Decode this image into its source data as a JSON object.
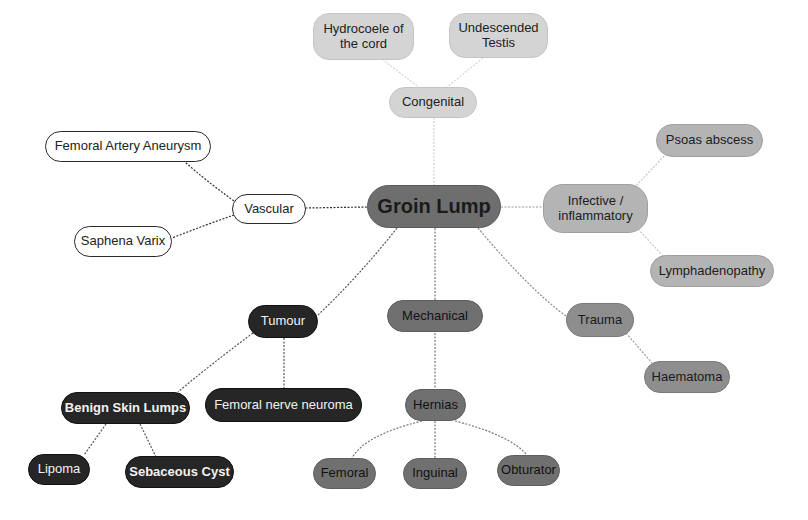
{
  "diagram": {
    "type": "mind-map",
    "root": "Groin Lump",
    "colors": {
      "root": "#6e6e6e",
      "congenital": "#d4d4d4",
      "infective": "#b4b4b4",
      "vascular": "#ffffff",
      "tumour": "#262626",
      "mechanical": "#707070",
      "trauma": "#8e8e8e"
    },
    "nodes": {
      "groin_lump": "Groin Lump",
      "congenital": "Congenital",
      "hydrocoele": "Hydrocoele of\nthe cord",
      "undescended": "Undescended\nTestis",
      "vascular": "Vascular",
      "femoral_artery_aneurysm": "Femoral Artery Aneurysm",
      "saphena_varix": "Saphena Varix",
      "infective": "Infective /\ninflammatory",
      "psoas_abscess": "Psoas abscess",
      "lymphadenopathy": "Lymphadenopathy",
      "tumour": "Tumour",
      "benign_skin_lumps": "Benign Skin Lumps",
      "femoral_nerve_neuroma": "Femoral nerve neuroma",
      "lipoma": "Lipoma",
      "sebaceous_cyst": "Sebaceous Cyst",
      "mechanical": "Mechanical",
      "hernias": "Hernias",
      "femoral": "Femoral",
      "inguinal": "Inguinal",
      "obturator": "Obturator",
      "trauma": "Trauma",
      "haematoma": "Haematoma"
    },
    "edges": [
      [
        "groin_lump",
        "congenital"
      ],
      [
        "congenital",
        "hydrocoele"
      ],
      [
        "congenital",
        "undescended"
      ],
      [
        "groin_lump",
        "vascular"
      ],
      [
        "vascular",
        "femoral_artery_aneurysm"
      ],
      [
        "vascular",
        "saphena_varix"
      ],
      [
        "groin_lump",
        "infective"
      ],
      [
        "infective",
        "psoas_abscess"
      ],
      [
        "infective",
        "lymphadenopathy"
      ],
      [
        "groin_lump",
        "tumour"
      ],
      [
        "tumour",
        "benign_skin_lumps"
      ],
      [
        "tumour",
        "femoral_nerve_neuroma"
      ],
      [
        "benign_skin_lumps",
        "lipoma"
      ],
      [
        "benign_skin_lumps",
        "sebaceous_cyst"
      ],
      [
        "groin_lump",
        "mechanical"
      ],
      [
        "mechanical",
        "hernias"
      ],
      [
        "hernias",
        "femoral"
      ],
      [
        "hernias",
        "inguinal"
      ],
      [
        "hernias",
        "obturator"
      ],
      [
        "groin_lump",
        "trauma"
      ],
      [
        "trauma",
        "haematoma"
      ]
    ]
  }
}
